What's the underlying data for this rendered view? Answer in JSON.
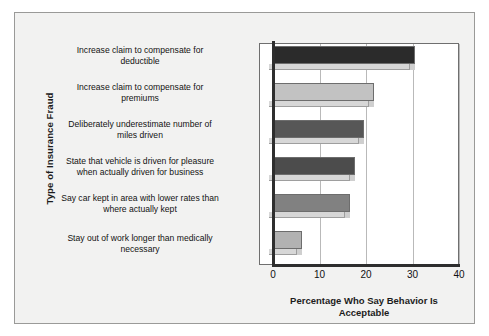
{
  "chart_data": {
    "type": "bar",
    "orientation": "horizontal",
    "title": "",
    "xlabel": "Percentage Who Say Behavior Is Acceptable",
    "ylabel": "Type of Insurance Fraud",
    "xlim": [
      0,
      40
    ],
    "xticks": [
      0,
      10,
      20,
      30,
      40
    ],
    "xtick_labels": [
      "0",
      "10",
      "20",
      "30",
      "40"
    ],
    "grid": "vertical",
    "legend": "none",
    "categories": [
      "Increase claim to compensate for deductible",
      "Increase claim to compensate for premiums",
      "Deliberately underestimate number of miles driven",
      "State that vehicle is driven for pleasure when actually driven for business",
      "Say car kept in area with lower rates than where actually kept",
      "Stay out of work longer than medically necessary"
    ],
    "values": [
      30.4,
      21.5,
      19.3,
      17.5,
      16.4,
      6.0
    ],
    "bar_colors": [
      "#2b2b2b",
      "#c2c2c2",
      "#575757",
      "#4c4c4c",
      "#818181",
      "#b2b2b2"
    ]
  },
  "axes": {
    "y_title": "Type of Insurance Fraud",
    "x_title_line1": "Percentage Who Say Behavior Is",
    "x_title_line2": "Acceptable"
  },
  "category_labels": [
    {
      "line1": "Increase claim to compensate for",
      "line2": "deductible"
    },
    {
      "line1": "Increase claim to compensate for",
      "line2": "premiums"
    },
    {
      "line1": "Deliberately underestimate number of",
      "line2": "miles driven"
    },
    {
      "line1": "State that vehicle is driven for pleasure",
      "line2": "when actually driven for business"
    },
    {
      "line1": "Say car kept in area with lower rates than",
      "line2": "where actually kept"
    },
    {
      "line1": "Stay out of work longer than medically",
      "line2": "necessary"
    }
  ],
  "colors": {
    "page_background": "#f2f2f1",
    "plot_background": "#ffffff",
    "axis": "#2e2e2e",
    "gridline": "#b9b9b9",
    "text": "#121212"
  }
}
